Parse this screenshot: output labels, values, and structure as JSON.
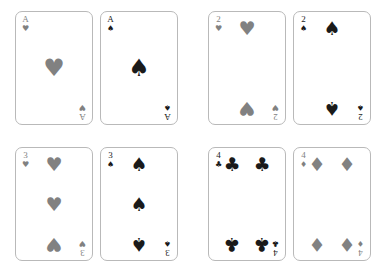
{
  "canvas": {
    "width": 386,
    "height": 272,
    "background": "#ffffff"
  },
  "style": {
    "card_background": "#ffffff",
    "card_border_color": "#b9b9b9",
    "red_suit_color": "#818181",
    "black_suit_color": "#1a1a1a"
  },
  "suit_glyphs": {
    "hearts": "♥",
    "spades": "♠",
    "clubs": "♣",
    "diamonds": "♦"
  },
  "groups": [
    {
      "name": "aces",
      "cards": [
        {
          "rank": "A",
          "suit": "hearts",
          "suit_glyph": "♥",
          "color": "red",
          "pip_layout": "ace",
          "pips": [
            {
              "x": 50,
              "y": 50,
              "flip": false,
              "big": true
            }
          ]
        },
        {
          "rank": "A",
          "suit": "spades",
          "suit_glyph": "♠",
          "color": "black",
          "pip_layout": "ace",
          "pips": [
            {
              "x": 50,
              "y": 50,
              "flip": false,
              "big": true
            }
          ]
        }
      ]
    },
    {
      "name": "twos",
      "cards": [
        {
          "rank": "2",
          "suit": "hearts",
          "suit_glyph": "♥",
          "color": "red",
          "pip_layout": "two",
          "pips": [
            {
              "x": 50,
              "y": 11,
              "flip": false,
              "big": false
            },
            {
              "x": 50,
              "y": 89,
              "flip": true,
              "big": false
            }
          ]
        },
        {
          "rank": "2",
          "suit": "spades",
          "suit_glyph": "♠",
          "color": "black",
          "pip_layout": "two",
          "pips": [
            {
              "x": 50,
              "y": 11,
              "flip": false,
              "big": false
            },
            {
              "x": 50,
              "y": 89,
              "flip": true,
              "big": false
            }
          ]
        }
      ]
    },
    {
      "name": "threes",
      "cards": [
        {
          "rank": "3",
          "suit": "hearts",
          "suit_glyph": "♥",
          "color": "red",
          "pip_layout": "three",
          "pips": [
            {
              "x": 50,
              "y": 11,
              "flip": false,
              "big": false
            },
            {
              "x": 50,
              "y": 50,
              "flip": false,
              "big": false
            },
            {
              "x": 50,
              "y": 89,
              "flip": true,
              "big": false
            }
          ]
        },
        {
          "rank": "3",
          "suit": "spades",
          "suit_glyph": "♠",
          "color": "black",
          "pip_layout": "three",
          "pips": [
            {
              "x": 50,
              "y": 11,
              "flip": false,
              "big": false
            },
            {
              "x": 50,
              "y": 50,
              "flip": false,
              "big": false
            },
            {
              "x": 50,
              "y": 89,
              "flip": true,
              "big": false
            }
          ]
        }
      ]
    },
    {
      "name": "fours",
      "cards": [
        {
          "rank": "4",
          "suit": "clubs",
          "suit_glyph": "♣",
          "color": "black",
          "pip_layout": "four",
          "pips": [
            {
              "x": 20,
              "y": 11,
              "flip": false,
              "big": false
            },
            {
              "x": 80,
              "y": 11,
              "flip": false,
              "big": false
            },
            {
              "x": 20,
              "y": 89,
              "flip": true,
              "big": false
            },
            {
              "x": 80,
              "y": 89,
              "flip": true,
              "big": false
            }
          ]
        },
        {
          "rank": "4",
          "suit": "diamonds",
          "suit_glyph": "♦",
          "color": "red",
          "pip_layout": "four",
          "pips": [
            {
              "x": 20,
              "y": 11,
              "flip": false,
              "big": false
            },
            {
              "x": 80,
              "y": 11,
              "flip": false,
              "big": false
            },
            {
              "x": 20,
              "y": 89,
              "flip": true,
              "big": false
            },
            {
              "x": 80,
              "y": 89,
              "flip": true,
              "big": false
            }
          ]
        }
      ]
    }
  ]
}
